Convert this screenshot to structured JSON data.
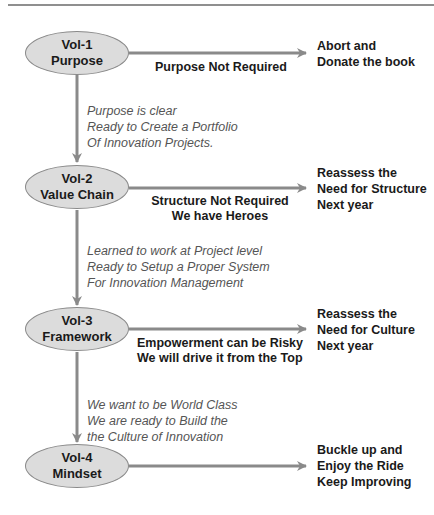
{
  "diagram": {
    "colors": {
      "stage_fill": "#dcdcdc",
      "stage_border": "#8a8a8a",
      "arrow": "#8a8a8a",
      "bold_text": "#1a1a1a",
      "italic_text": "#555555"
    },
    "stages": [
      {
        "vol": "Vol-1",
        "name": "Purpose",
        "reject_label": [
          "Purpose Not Required"
        ],
        "outcome": [
          "Abort and",
          "Donate the book"
        ],
        "proceed_label": [
          "Purpose is clear",
          "Ready to Create a Portfolio",
          "Of Innovation Projects."
        ]
      },
      {
        "vol": "Vol-2",
        "name": "Value Chain",
        "reject_label": [
          "Structure Not Required",
          "We have Heroes"
        ],
        "outcome": [
          "Reassess the",
          "Need for Structure",
          "Next year"
        ],
        "proceed_label": [
          "Learned to work at Project level",
          "Ready to Setup a Proper System",
          "For Innovation Management"
        ]
      },
      {
        "vol": "Vol-3",
        "name": "Framework",
        "reject_label": [
          "Empowerment can be Risky",
          "We will drive it from the Top"
        ],
        "outcome": [
          "Reassess the",
          "Need for Culture",
          "Next year"
        ],
        "proceed_label": [
          "We want to be World Class",
          "We are ready to Build the",
          "the Culture of Innovation"
        ]
      },
      {
        "vol": "Vol-4",
        "name": "Mindset",
        "reject_label": [],
        "outcome": [
          "Buckle up and",
          "Enjoy the Ride",
          "Keep Improving"
        ]
      }
    ]
  }
}
